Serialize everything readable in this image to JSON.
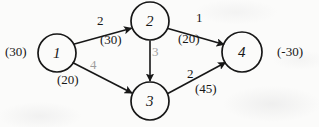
{
  "diagram": {
    "ink_color": "#171717",
    "background_color": "#fbfbfa",
    "nodes": [
      {
        "id": "1",
        "label": "1",
        "cx": 57,
        "cy": 53,
        "r": 19
      },
      {
        "id": "2",
        "label": "2",
        "cx": 150,
        "cy": 21,
        "r": 19
      },
      {
        "id": "3",
        "label": "3",
        "cx": 150,
        "cy": 101,
        "r": 19
      },
      {
        "id": "4",
        "label": "4",
        "cx": 242,
        "cy": 52,
        "r": 20
      }
    ],
    "edges": [
      {
        "id": "e12",
        "from": "1",
        "to": "2",
        "cost": "2",
        "capacity": "(30)",
        "faint": false
      },
      {
        "id": "e13",
        "from": "1",
        "to": "3",
        "cost": "4",
        "capacity": "(20)",
        "faint": true
      },
      {
        "id": "e23",
        "from": "2",
        "to": "3",
        "cost": "3",
        "capacity": "",
        "faint": true
      },
      {
        "id": "e24",
        "from": "2",
        "to": "4",
        "cost": "1",
        "capacity": "(20)",
        "faint": false
      },
      {
        "id": "e34",
        "from": "3",
        "to": "4",
        "cost": "2",
        "capacity": "(45)",
        "faint": false
      }
    ],
    "terminals": {
      "supply": "(30)",
      "demand": "(-30)"
    }
  }
}
